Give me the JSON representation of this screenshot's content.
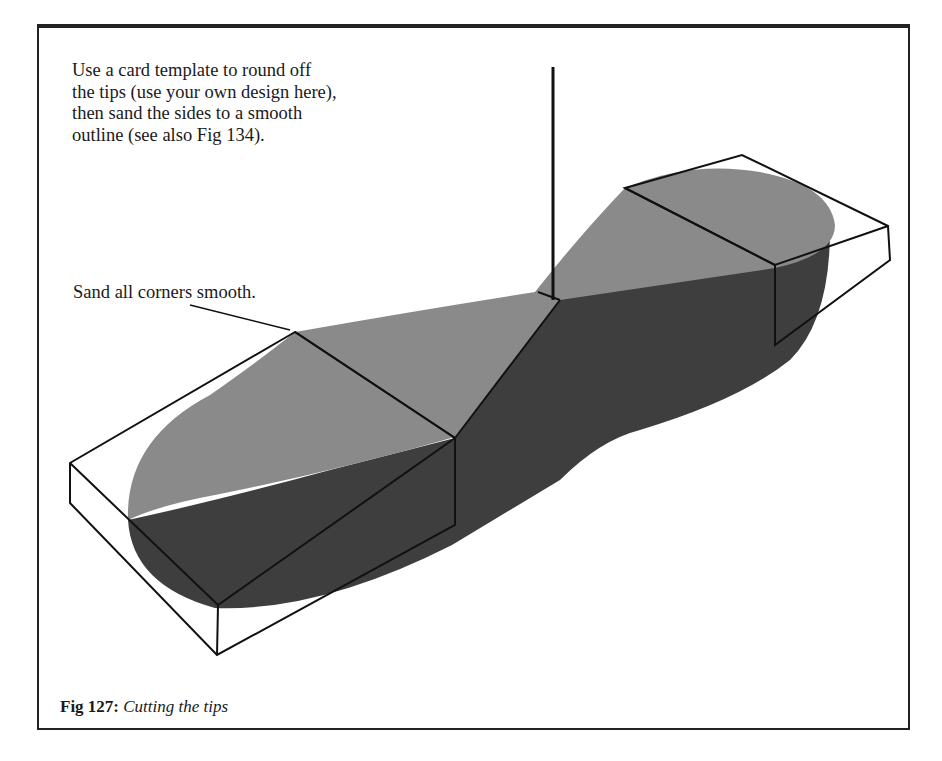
{
  "figure": {
    "number_label": "Fig 127:",
    "title": "Cutting the tips"
  },
  "annotations": {
    "instruction_lines": [
      "Use a card template to round off",
      "the tips (use your own design here),",
      "then sand the sides to a smooth",
      "outline (see also Fig 134)."
    ],
    "callout": "Sand all corners smooth."
  },
  "colors": {
    "top_face": "#8a8a8a",
    "side_face": "#3e3e3e",
    "outline": "#111111",
    "frame": "#222222"
  }
}
